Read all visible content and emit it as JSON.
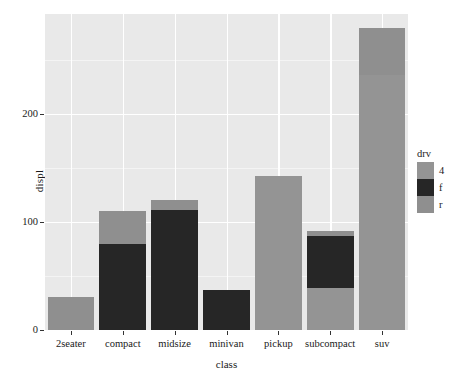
{
  "chart_data": {
    "type": "bar",
    "title": "",
    "subtitle": "",
    "xlabel": "class",
    "ylabel": "displ",
    "stacked": true,
    "grid": true,
    "legend_position": "right",
    "legend_title": "drv",
    "categories": [
      "2seater",
      "compact",
      "midsize",
      "minivan",
      "pickup",
      "subcompact",
      "suv"
    ],
    "ylim": [
      0,
      294
    ],
    "yticks": [
      0,
      100,
      200
    ],
    "ytick_labels": [
      "0",
      "100",
      "200"
    ],
    "series": [
      {
        "name": "4",
        "color": "#949494",
        "values": [
          0,
          0,
          0,
          0,
          143,
          39,
          236
        ]
      },
      {
        "name": "f",
        "color": "#262626",
        "values": [
          0,
          80,
          111,
          37,
          0,
          48,
          0
        ]
      },
      {
        "name": "r",
        "color": "#8f8f8f",
        "values": [
          31,
          30,
          9,
          0,
          0,
          5,
          44
        ]
      }
    ],
    "totals": [
      31,
      110,
      120,
      37,
      143,
      92,
      280
    ]
  },
  "legend": {
    "title": "drv",
    "items": [
      {
        "label": "4",
        "color": "#949494"
      },
      {
        "label": "f",
        "color": "#262626"
      },
      {
        "label": "r",
        "color": "#8f8f8f"
      }
    ]
  },
  "axes": {
    "y_title": "displ",
    "x_title": "class",
    "y_tick_labels": [
      "200",
      "100",
      "0"
    ],
    "x_tick_labels": [
      "2seater",
      "compact",
      "midsize",
      "minivan",
      "pickup",
      "subcompact",
      "suv"
    ]
  },
  "colors": {
    "panel_background": "#e9e9e9",
    "gridline_major": "#ffffff",
    "gridline_minor": "#f4f4f4",
    "axis_text": "#1a1a1a",
    "plot_background": "#ffffff"
  }
}
